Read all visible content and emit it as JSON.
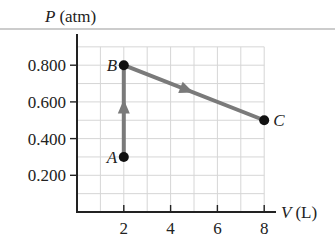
{
  "chart_data": {
    "type": "line",
    "title": "",
    "xlabel": "V (L)",
    "ylabel": "P (atm)",
    "xlabel_var": "V",
    "xlabel_unit": "(L)",
    "ylabel_var": "P",
    "ylabel_unit": "(atm)",
    "xlim": [
      0,
      8.5
    ],
    "ylim": [
      0,
      0.9
    ],
    "x_ticks": [
      2,
      4,
      6,
      8
    ],
    "x_tick_labels": [
      "2",
      "4",
      "6",
      "8"
    ],
    "y_ticks": [
      0.2,
      0.4,
      0.6,
      0.8
    ],
    "y_tick_labels": [
      "0.200",
      "0.400",
      "0.600",
      "0.800"
    ],
    "grid": true,
    "grid_x_step": 1,
    "grid_y_step": 0.1,
    "series": [
      {
        "name": "process path A→B→C",
        "points": [
          {
            "label": "A",
            "x": 2,
            "y": 0.3
          },
          {
            "label": "B",
            "x": 2,
            "y": 0.8
          },
          {
            "label": "C",
            "x": 8,
            "y": 0.5
          }
        ],
        "arrows": [
          "A→B",
          "B→C"
        ],
        "color": "#7a7a7a"
      }
    ]
  },
  "colors": {
    "path": "#7a7a7a",
    "grid": "#d6d6d6",
    "axis": "#222222",
    "point": "#111111",
    "rule": "#9a9a9a"
  }
}
